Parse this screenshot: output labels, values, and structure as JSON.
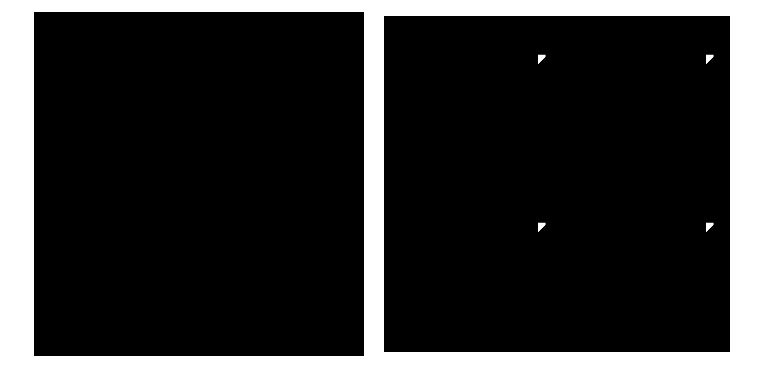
{
  "figure": {
    "kind": "side-by-side-pattern-comparison",
    "width": 757,
    "height": 373,
    "background_color": "#ffffff",
    "ink_color": "#000000",
    "panel_count": 2,
    "gap_px": 1
  },
  "panels": [
    {
      "id": "left",
      "name": "geometric-cross-lattice-pattern",
      "description": "Sparse black-on-white cross-stitch style lattice of dotted diagonal X-crosses alternating with floral rosettes, small quatrefoil and diamond fillers, and short diagonal ladder bars",
      "x": 0,
      "y": 0,
      "width": 378,
      "height": 373,
      "content_box": {
        "x": 34,
        "y": 12,
        "width": 330,
        "height": 344
      },
      "background_color": "#ffffff",
      "ink_color": "#000000",
      "ink_density": "low",
      "tile_size": 100,
      "tile_offset_x": -12,
      "tile_offset_y": -18,
      "symmetry": "p4m",
      "motifs": [
        {
          "name": "dotted-x-cross",
          "count_per_tile": 1,
          "position": "tile-corner",
          "description": "four beaded diagonal arms meeting at a dense center knot, each arm tipped with a small arrowhead cross"
        },
        {
          "name": "rosette-flower",
          "count_per_tile": 1,
          "position": "tile-center",
          "description": "round eight-lobed blossom with light centre"
        },
        {
          "name": "quatrefoil-plus",
          "count_per_tile": 4,
          "position": "axis-midpoints",
          "description": "small four-dot plus / clover"
        },
        {
          "name": "small-diamond",
          "count_per_tile": 4,
          "position": "edge-midpoints",
          "description": "four-dot diamond lozenge"
        },
        {
          "name": "diagonal-ladder-bar",
          "count_per_tile": 4,
          "position": "around-rosette",
          "description": "short slanted double-rule bar with ticks"
        }
      ]
    },
    {
      "id": "right",
      "name": "dense-medallion-batik-pattern",
      "description": "Dense black-on-white batik style field of diamond medallions with bone-arm crosses, solid spades and hearts, checkerboard lozenges, banded bars, triangles and scalloped dotted arcs",
      "x": 379,
      "y": 0,
      "width": 378,
      "height": 373,
      "content_box": {
        "x": 5,
        "y": 16,
        "width": 346,
        "height": 336
      },
      "background_color": "#ffffff",
      "ink_color": "#000000",
      "ink_density": "high",
      "tile_size": 168,
      "tile_offset_x": -14,
      "tile_offset_y": -16,
      "symmetry": "p4m",
      "motifs": [
        {
          "name": "solid-diamond-node",
          "count_per_tile": 1,
          "position": "tile-center",
          "description": "solid black diamond hub"
        },
        {
          "name": "bone-arm-cross",
          "count_per_tile": 4,
          "position": "diagonals-from-hub",
          "description": "tapered diagonal arm ending in a Y-fork with two round knobs"
        },
        {
          "name": "solid-spade",
          "count_per_tile": 4,
          "position": "cardinal-of-hub",
          "description": "filled spade with short stem"
        },
        {
          "name": "solid-heart",
          "count_per_tile": 4,
          "position": "between-medallions",
          "description": "filled heart shape"
        },
        {
          "name": "checkerboard-lozenge",
          "count_per_tile": 8,
          "position": "quadrant-fillers",
          "description": "diamond built from a checkerboard of small squares"
        },
        {
          "name": "four-dot-floret",
          "count_per_tile": 8,
          "position": "quadrant-fillers",
          "description": "tiny four-petal floret"
        },
        {
          "name": "striped-banded-bar",
          "count_per_tile": 4,
          "position": "on-axes",
          "description": "thick bar split by white ruling lines"
        },
        {
          "name": "solid-triangle",
          "count_per_tile": 8,
          "position": "axis-flanks",
          "description": "filled triangle pointing toward the axis"
        },
        {
          "name": "scalloped-dotted-arc",
          "count_per_tile": 4,
          "position": "medallion-border",
          "description": "arc of beads and dashes sweeping between medallion corners"
        },
        {
          "name": "diagonal-ladder-bar",
          "count_per_tile": 8,
          "position": "quadrant-fillers",
          "description": "slanted triple-rule bar"
        },
        {
          "name": "small-square-dot",
          "count_per_tile": 24,
          "position": "scattered",
          "description": "small solid square"
        }
      ]
    }
  ]
}
